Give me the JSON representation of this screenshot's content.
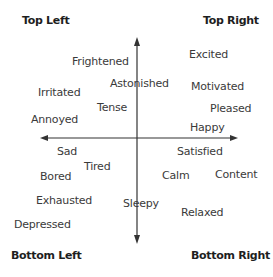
{
  "corners": {
    "top_left": "Top Left",
    "top_right": "Top Right",
    "bottom_left": "Bottom Left",
    "bottom_right": "Bottom Right"
  },
  "emotions": {
    "frightened": "Frightened",
    "astonished": "Astonished",
    "irritated": "Irritated",
    "tense": "Tense",
    "annoyed": "Annoyed",
    "excited": "Excited",
    "motivated": "Motivated",
    "pleased": "Pleased",
    "happy": "Happy",
    "sad": "Sad",
    "tired": "Tired",
    "bored": "Bored",
    "exhausted": "Exhausted",
    "sleepy": "Sleepy",
    "depressed": "Depressed",
    "satisfied": "Satisfied",
    "calm": "Calm",
    "content": "Content",
    "relaxed": "Relaxed"
  },
  "colors": {
    "axis": "#333333",
    "text": "#3a3a3a",
    "heading": "#1e1e1e"
  }
}
